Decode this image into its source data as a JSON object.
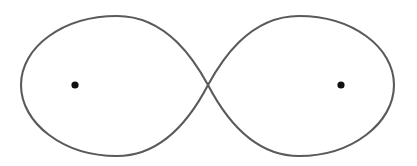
{
  "figure": {
    "name": "lemniscate-figure-eight",
    "width": 417,
    "height": 166,
    "background_color": "#ffffff"
  },
  "curve": {
    "label": "lemniscate-curve",
    "shape": "figure-eight",
    "stroke_color": "#5a5a5a",
    "stroke_width": 2.1,
    "fill": "none",
    "crossing_point": {
      "x": 208,
      "y": 85
    },
    "bounds": {
      "left": 21,
      "right": 394,
      "top": 16,
      "bottom": 156
    },
    "left_lobe_extreme_x": 21,
    "right_lobe_extreme_x": 394,
    "half_width": 187,
    "half_height": 70,
    "path": "M 208 85 C 196 63 168 16 117 16 C 63 16 21 47 21 85 C 21 123 63 156 117 156 C 168 156 196 108 208 85 C 220 63 248 16 299 16 C 352 16 394 47 394 85 C 394 123 352 156 299 156 C 248 156 220 108 208 85 Z"
  },
  "points": [
    {
      "label": "left-focus-point",
      "x": 75,
      "y": 85,
      "radius": 3.6,
      "color": "#111111"
    },
    {
      "label": "right-focus-point",
      "x": 341,
      "y": 85,
      "radius": 3.6,
      "color": "#111111"
    }
  ]
}
